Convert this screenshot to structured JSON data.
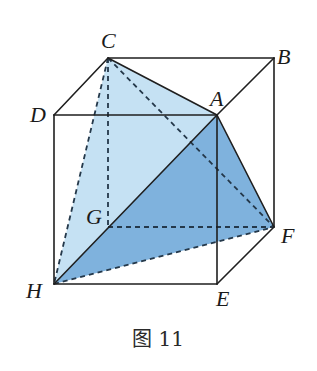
{
  "figure": {
    "caption": "图 11",
    "colors": {
      "background": "#ffffff",
      "face_light": "#c5e1f3",
      "face_dark": "#7fb2dd",
      "edge": "#1f1f1f",
      "dashed_edge": "#24384a"
    },
    "vertices": {
      "A": {
        "label": "A",
        "x": 217,
        "y": 115
      },
      "B": {
        "label": "B",
        "x": 274,
        "y": 58
      },
      "C": {
        "label": "C",
        "x": 108,
        "y": 58
      },
      "D": {
        "label": "D",
        "x": 54,
        "y": 115
      },
      "E": {
        "label": "E",
        "x": 217,
        "y": 284
      },
      "F": {
        "label": "F",
        "x": 274,
        "y": 227
      },
      "G": {
        "label": "G",
        "x": 108,
        "y": 227
      },
      "H": {
        "label": "H",
        "x": 54,
        "y": 284
      }
    },
    "labels": {
      "A": "A",
      "B": "B",
      "C": "C",
      "D": "D",
      "E": "E",
      "F": "F",
      "G": "G",
      "H": "H"
    },
    "faces": [
      {
        "name": "CAH",
        "shade": "light"
      },
      {
        "name": "AHF",
        "shade": "dark"
      }
    ],
    "solid_edges": [
      "DA",
      "AB",
      "CB",
      "DC",
      "DH",
      "HE",
      "EF",
      "BF",
      "AE",
      "CA",
      "AH",
      "AF"
    ],
    "dashed_edges": [
      "CG",
      "GF",
      "CH",
      "CF",
      "HF"
    ]
  }
}
